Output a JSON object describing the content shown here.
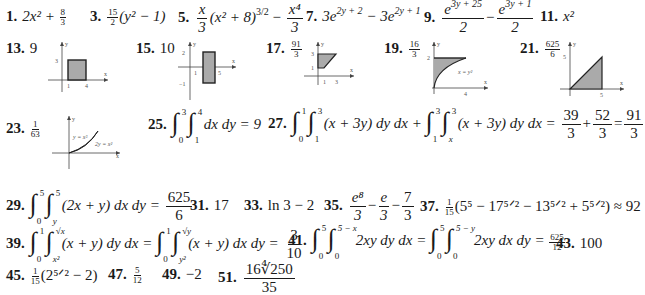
{
  "answers": {
    "a1": {
      "num": "1.",
      "text": "2x² + ",
      "frac": [
        "8",
        "3"
      ]
    },
    "a3": {
      "num": "3.",
      "frac": [
        "15",
        "2"
      ],
      "text": "(y² − 1)"
    },
    "a5": {
      "num": "5.",
      "f1": [
        "x",
        "3"
      ],
      "mid": "(x² + 8)",
      "exp": "3/2",
      "minus": " − ",
      "f2": [
        "x⁴",
        "3"
      ]
    },
    "a7": {
      "num": "7.",
      "t1": "3e",
      "e1": "2y + 2",
      "minus": " − 3e",
      "e2": "2y + 1"
    },
    "a9": {
      "num": "9.",
      "f1n": "e",
      "f1e": "3y + 25",
      "f1d": "2",
      "minus": "−",
      "f2n": "e",
      "f2e": "3y + 1",
      "f2d": "2"
    },
    "a11": {
      "num": "11.",
      "text": "x²"
    },
    "a13": {
      "num": "13.",
      "text": "9"
    },
    "a15": {
      "num": "15.",
      "text": "10"
    },
    "a17": {
      "num": "17.",
      "frac": [
        "91",
        "3"
      ]
    },
    "a19": {
      "num": "19.",
      "frac": [
        "16",
        "3"
      ]
    },
    "a21": {
      "num": "21.",
      "frac": [
        "625",
        "6"
      ]
    },
    "a23": {
      "num": "23.",
      "frac": [
        "1",
        "63"
      ]
    },
    "a25": {
      "num": "25.",
      "i1": [
        "3",
        "0"
      ],
      "i2": [
        "4",
        "1"
      ],
      "tail": "dx dy = 9"
    },
    "a27": {
      "num": "27.",
      "i1": [
        "1",
        "0"
      ],
      "i2": [
        "3",
        "1"
      ],
      "body1": "(x + 3y) dy dx + ",
      "i3": [
        "3",
        "1"
      ],
      "i4": [
        "3",
        "x"
      ],
      "body2": "(x + 3y) dy dx = ",
      "f1": [
        "39",
        "3"
      ],
      "plus": "+",
      "f2": [
        "52",
        "3"
      ],
      "eq": "=",
      "f3": [
        "91",
        "3"
      ]
    },
    "a29": {
      "num": "29.",
      "i1": [
        "5",
        "0"
      ],
      "i2": [
        "5",
        "y"
      ],
      "body": "(2x + y) dx dy = ",
      "f": [
        "625",
        "6"
      ]
    },
    "a31": {
      "num": "31.",
      "text": "17"
    },
    "a33": {
      "num": "33.",
      "text": "ln 3 − 2"
    },
    "a35": {
      "num": "35.",
      "f1": [
        "e⁸",
        "3"
      ],
      "m1": "−",
      "f2": [
        "e",
        "3"
      ],
      "m2": "−",
      "f3": [
        "7",
        "3"
      ]
    },
    "a37": {
      "num": "37.",
      "frac": [
        "1",
        "15"
      ],
      "text": "(5⁵ − 17⁵ᐟ² − 13⁵ᐟ² + 5⁵ᐟ²) ≈ 92"
    },
    "a39": {
      "num": "39.",
      "i1": [
        "1",
        "0"
      ],
      "i2": [
        "√x",
        "x²"
      ],
      "body1": "(x + y) dy dx = ",
      "i3": [
        "1",
        "0"
      ],
      "i4": [
        "√y",
        "y²"
      ],
      "body2": "(x + y) dx dy = ",
      "f": [
        "3",
        "10"
      ]
    },
    "a41": {
      "num": "41.",
      "i1": [
        "5",
        "0"
      ],
      "i2": [
        "5 − x",
        "0"
      ],
      "body1": "2xy dy dx = ",
      "i3": [
        "5",
        "0"
      ],
      "i4": [
        "5 − y",
        "0"
      ],
      "body2": "2xy dx dy = ",
      "f": [
        "625",
        "12"
      ]
    },
    "a43": {
      "num": "43.",
      "text": "100"
    },
    "a45": {
      "num": "45.",
      "frac": [
        "1",
        "15"
      ],
      "text": "(2⁵ᐟ² − 2)"
    },
    "a47": {
      "num": "47.",
      "frac": [
        "5",
        "12"
      ]
    },
    "a49": {
      "num": "49.",
      "text": "−2"
    },
    "a51": {
      "num": "51.",
      "n": "16∜250",
      "d": "35"
    }
  },
  "graphs": {
    "g13": {
      "y": "y",
      "x": "x",
      "ty": "3",
      "tx1": "1",
      "tx2": "4"
    },
    "g15": {
      "y": "y",
      "x": "x",
      "ty1": "2",
      "ty2": "−1",
      "tx1": "1",
      "tx2": "5"
    },
    "g17": {
      "y": "y",
      "x": "x",
      "ty1": "3",
      "ty2": "1",
      "tx1": "1",
      "tx2": "3"
    },
    "g19": {
      "y": "y",
      "x": "x",
      "ty": "2",
      "tx": "4",
      "curve": "x = y²"
    },
    "g21": {
      "y": "y",
      "x": "x",
      "ty": "5",
      "tx": "5"
    },
    "g23": {
      "y": "y",
      "x": "x",
      "c1": "y = x³",
      "c2": "2y = x²"
    }
  }
}
